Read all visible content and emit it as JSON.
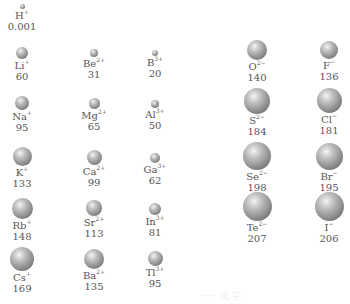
{
  "diagram": {
    "ions": [
      {
        "id": "H",
        "symbol": "H",
        "charge": "+",
        "radius": "0.001",
        "x": 22,
        "y": 4,
        "d": 5
      },
      {
        "id": "Li",
        "symbol": "Li",
        "charge": "+",
        "radius": "60",
        "x": 22,
        "y": 47,
        "d": 12
      },
      {
        "id": "Be",
        "symbol": "Be",
        "charge": "2+",
        "radius": "31",
        "x": 94,
        "y": 49,
        "d": 8
      },
      {
        "id": "B",
        "symbol": "B",
        "charge": "3+",
        "radius": "20",
        "x": 155,
        "y": 50,
        "d": 6
      },
      {
        "id": "O",
        "symbol": "O",
        "charge": "2−",
        "radius": "140",
        "x": 257,
        "y": 40,
        "d": 20
      },
      {
        "id": "F",
        "symbol": "F",
        "charge": "−",
        "radius": "136",
        "x": 329,
        "y": 41,
        "d": 18
      },
      {
        "id": "Na",
        "symbol": "Na",
        "charge": "+",
        "radius": "95",
        "x": 22,
        "y": 96,
        "d": 14
      },
      {
        "id": "Mg",
        "symbol": "Mg",
        "charge": "2+",
        "radius": "65",
        "x": 94,
        "y": 98,
        "d": 11
      },
      {
        "id": "Al",
        "symbol": "Al",
        "charge": "3+",
        "radius": "50",
        "x": 155,
        "y": 100,
        "d": 8
      },
      {
        "id": "S",
        "symbol": "S",
        "charge": "2−",
        "radius": "184",
        "x": 257,
        "y": 88,
        "d": 26
      },
      {
        "id": "Cl",
        "symbol": "Cl",
        "charge": "−",
        "radius": "181",
        "x": 329,
        "y": 88,
        "d": 25
      },
      {
        "id": "K",
        "symbol": "K",
        "charge": "+",
        "radius": "133",
        "x": 22,
        "y": 147,
        "d": 19
      },
      {
        "id": "Ca",
        "symbol": "Ca",
        "charge": "2+",
        "radius": "99",
        "x": 94,
        "y": 150,
        "d": 15
      },
      {
        "id": "Ga",
        "symbol": "Ga",
        "charge": "3+",
        "radius": "62",
        "x": 155,
        "y": 153,
        "d": 10
      },
      {
        "id": "Se",
        "symbol": "Se",
        "charge": "2−",
        "radius": "198",
        "x": 257,
        "y": 142,
        "d": 28
      },
      {
        "id": "Br",
        "symbol": "Br",
        "charge": "−",
        "radius": "195",
        "x": 329,
        "y": 143,
        "d": 27
      },
      {
        "id": "Rb",
        "symbol": "Rb",
        "charge": "+",
        "radius": "148",
        "x": 22,
        "y": 198,
        "d": 21
      },
      {
        "id": "Sr",
        "symbol": "Sr",
        "charge": "2+",
        "radius": "113",
        "x": 94,
        "y": 200,
        "d": 16
      },
      {
        "id": "In",
        "symbol": "In",
        "charge": "3+",
        "radius": "81",
        "x": 155,
        "y": 203,
        "d": 12
      },
      {
        "id": "Te",
        "symbol": "Te",
        "charge": "2−",
        "radius": "207",
        "x": 257,
        "y": 192,
        "d": 29
      },
      {
        "id": "I",
        "symbol": "I",
        "charge": "−",
        "radius": "206",
        "x": 329,
        "y": 192,
        "d": 29
      },
      {
        "id": "Cs",
        "symbol": "Cs",
        "charge": "+",
        "radius": "169",
        "x": 22,
        "y": 247,
        "d": 24
      },
      {
        "id": "Ba",
        "symbol": "Ba",
        "charge": "2+",
        "radius": "135",
        "x": 94,
        "y": 249,
        "d": 20
      },
      {
        "id": "Tl",
        "symbol": "Tl",
        "charge": "3+",
        "radius": "95",
        "x": 155,
        "y": 251,
        "d": 15
      }
    ]
  },
  "watermark": "······ 化 学"
}
